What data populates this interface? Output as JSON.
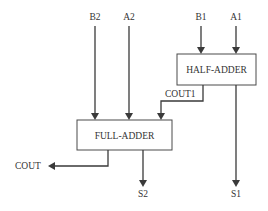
{
  "diagram": {
    "type": "block-diagram",
    "title": "",
    "blocks": [
      {
        "id": "half_adder",
        "label": "HALF-ADDER"
      },
      {
        "id": "full_adder",
        "label": "FULL-ADDER"
      }
    ],
    "inputs": {
      "b2": "B2",
      "a2": "A2",
      "b1": "B1",
      "a1": "A1"
    },
    "signals": {
      "cout1": "COUT1"
    },
    "outputs": {
      "cout": "COUT",
      "s2": "S2",
      "s1": "S1"
    },
    "connections": [
      {
        "from": "B1",
        "to": "HALF-ADDER"
      },
      {
        "from": "A1",
        "to": "HALF-ADDER"
      },
      {
        "from": "HALF-ADDER",
        "to": "S1"
      },
      {
        "from": "HALF-ADDER",
        "to": "FULL-ADDER",
        "label": "COUT1"
      },
      {
        "from": "B2",
        "to": "FULL-ADDER"
      },
      {
        "from": "A2",
        "to": "FULL-ADDER"
      },
      {
        "from": "FULL-ADDER",
        "to": "S2"
      },
      {
        "from": "FULL-ADDER",
        "to": "COUT"
      }
    ],
    "colors": {
      "line": "#3a3a3a",
      "text": "#333333",
      "background": "#ffffff"
    }
  }
}
